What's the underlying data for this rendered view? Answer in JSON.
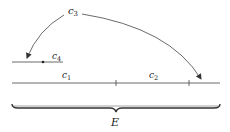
{
  "diagram": {
    "labels": {
      "c3": "c",
      "c3_sub": "3",
      "c4": "c",
      "c4_sub": "4",
      "c1": "c",
      "c1_sub": "1",
      "c2": "c",
      "c2_sub": "2",
      "E": "E"
    },
    "colors": {
      "stroke": "#444444",
      "text": "#222222",
      "background": "#ffffff"
    }
  }
}
